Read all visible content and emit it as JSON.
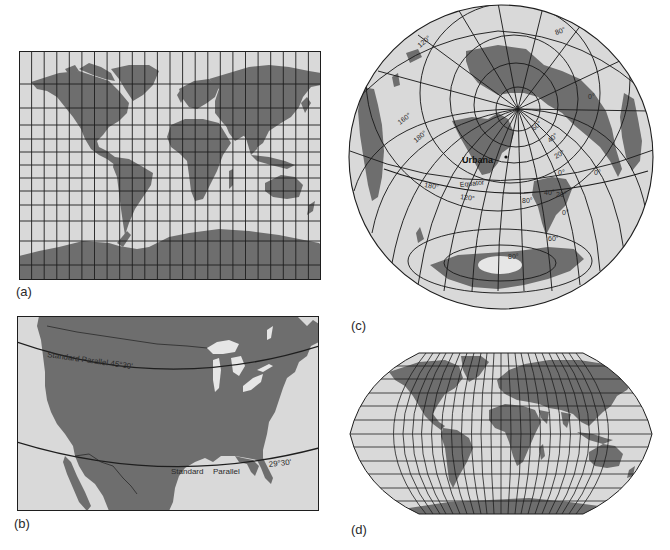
{
  "colors": {
    "ocean": "#d9d9d9",
    "land": "#6e6e6e",
    "grid": "#1e1e1e",
    "lake": "#e6e6e6",
    "label": "#2a2a2a"
  },
  "panels": [
    {
      "id": "a",
      "label": "(a)",
      "projection": "Mercator",
      "graticule": {
        "meridians": 24,
        "parallels": 13
      }
    },
    {
      "id": "b",
      "label": "(b)",
      "projection": "Albers conic (United States)",
      "annotations": {
        "upper_parallel": "Standard Parallel 45°30'",
        "lower_parallel_word1": "Standard",
        "lower_parallel_word2": "Parallel",
        "lower_parallel_value": "29°30'"
      }
    },
    {
      "id": "c",
      "label": "(c)",
      "projection": "Azimuthal (centered on Urbana)",
      "annotations": {
        "city": "Urbana",
        "equator": "Equator",
        "lon_labels": [
          "120°",
          "160°",
          "180°",
          "180°",
          "120°",
          "80°"
        ],
        "lat_labels_right": [
          "80°",
          "60°",
          "40°",
          "20°",
          "0°",
          "0°",
          "0°",
          "20°",
          "40°",
          "0°",
          "60°",
          "80°"
        ]
      }
    },
    {
      "id": "d",
      "label": "(d)",
      "projection": "Robinson",
      "graticule": {
        "meridians": 24,
        "parallels": 12
      }
    }
  ],
  "c_labels": {
    "l120": "120°",
    "l160": "160°",
    "l180a": "180°",
    "l180b": "180°",
    "l120b": "120°",
    "l80": "80°",
    "top80": "80°",
    "r60": "60°",
    "r40": "40°",
    "r20": "20°",
    "r0a": "0°",
    "r0b": "0°",
    "r0c": "0°",
    "r40b": "40°",
    "r20b": "20°",
    "r0d": "0°",
    "s60": "60°",
    "s80": "80°",
    "city": "Urbana",
    "equator": "Equator"
  }
}
